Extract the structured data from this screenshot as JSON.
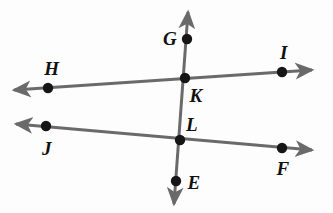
{
  "figure": {
    "background_color": "#fdfdfd",
    "line_color": "#6a6a6a",
    "point_color": "#161616",
    "label_color": "#111111",
    "line_width": 3,
    "point_radius": 5.2,
    "width": 333,
    "height": 213
  },
  "points": [
    {
      "id": "G",
      "label": "G",
      "x": 187,
      "y": 39,
      "label_x": 170,
      "label_y": 38
    },
    {
      "id": "I",
      "label": "I",
      "x": 282,
      "y": 72,
      "label_x": 284,
      "label_y": 52
    },
    {
      "id": "H",
      "label": "H",
      "x": 48,
      "y": 88,
      "label_x": 52,
      "label_y": 68
    },
    {
      "id": "K",
      "label": "K",
      "x": 185,
      "y": 78,
      "label_x": 196,
      "label_y": 95
    },
    {
      "id": "L",
      "label": "L",
      "x": 180,
      "y": 140,
      "label_x": 192,
      "label_y": 124
    },
    {
      "id": "J",
      "label": "J",
      "x": 46,
      "y": 126,
      "label_x": 47,
      "label_y": 148
    },
    {
      "id": "F",
      "label": "F",
      "x": 282,
      "y": 148,
      "label_x": 283,
      "label_y": 168
    },
    {
      "id": "E",
      "label": "E",
      "x": 176,
      "y": 181,
      "label_x": 194,
      "label_y": 182
    }
  ],
  "lines": [
    {
      "id": "line-HI",
      "name": "line-h-i",
      "from_label": "H",
      "to_label": "I",
      "x1": 14,
      "y1": 90,
      "x2": 312,
      "y2": 70,
      "arrow_start": true,
      "arrow_end": true
    },
    {
      "id": "line-JF",
      "name": "line-j-f",
      "from_label": "J",
      "to_label": "F",
      "x1": 16,
      "y1": 124,
      "x2": 312,
      "y2": 150,
      "arrow_start": true,
      "arrow_end": true
    },
    {
      "id": "line-GE",
      "name": "line-g-e",
      "from_label": "G",
      "to_label": "E",
      "x1": 188,
      "y1": 12,
      "x2": 174,
      "y2": 204,
      "arrow_start": true,
      "arrow_end": true
    }
  ]
}
